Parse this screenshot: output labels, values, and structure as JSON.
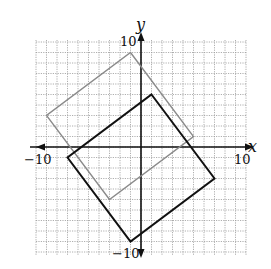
{
  "chart_data": {
    "type": "line",
    "title": "",
    "xlabel": "x",
    "ylabel": "y",
    "xlim": [
      -10,
      10
    ],
    "ylim": [
      -10,
      10
    ],
    "grid": true,
    "grid_step": 1,
    "tick_labels": {
      "x_min": "−10",
      "x_max": "10",
      "y_min": "−10",
      "y_max": "10"
    },
    "series": [
      {
        "name": "original-square",
        "color": "#8a8a8a",
        "closed": true,
        "points": [
          [
            -1,
            9
          ],
          [
            5,
            1
          ],
          [
            -3,
            -5
          ],
          [
            -9,
            3
          ]
        ]
      },
      {
        "name": "translated-square",
        "color": "#111111",
        "closed": true,
        "points": [
          [
            1,
            5
          ],
          [
            7,
            -3
          ],
          [
            -1,
            -9
          ],
          [
            -7,
            -1
          ]
        ]
      }
    ],
    "annotations": []
  }
}
